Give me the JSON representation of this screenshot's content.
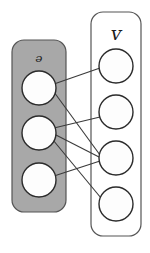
{
  "diagram": {
    "type": "bipartite-graph",
    "background_color": "#ffffff",
    "stroke_color": "#2b2b2b",
    "edge_color": "#3a3a3a"
  },
  "left_set": {
    "label": "ᵊ",
    "label_plain": "U",
    "box_fill": "#a8a8a8",
    "box_stroke": "#555555",
    "box": {
      "x": 12,
      "y": 40,
      "width": 54,
      "height": 172,
      "radius": 12
    },
    "node_fill": "#fdfdfd",
    "node_stroke": "#2b2b2b",
    "nodes": [
      {
        "id": "u1",
        "name": "u1",
        "cx": 39,
        "cy": 88,
        "r": 17
      },
      {
        "id": "u2",
        "name": "u2",
        "cx": 39,
        "cy": 133,
        "r": 17
      },
      {
        "id": "u3",
        "name": "u3",
        "cx": 39,
        "cy": 180,
        "r": 17
      }
    ],
    "label_pos": {
      "x": 39,
      "y": 63
    },
    "label_size": 19
  },
  "right_set": {
    "label": "ᴠ",
    "label_plain": "V",
    "box_fill": "#ffffff",
    "box_stroke": "#555555",
    "box": {
      "x": 91,
      "y": 12,
      "width": 50,
      "height": 224,
      "radius": 12
    },
    "node_fill": "#fdfdfd",
    "node_stroke": "#2b2b2b",
    "nodes": [
      {
        "id": "v1",
        "name": "v1",
        "cx": 116,
        "cy": 66,
        "r": 17
      },
      {
        "id": "v2",
        "name": "v2",
        "cx": 116,
        "cy": 112,
        "r": 17
      },
      {
        "id": "v3",
        "name": "v3",
        "cx": 116,
        "cy": 158,
        "r": 17
      },
      {
        "id": "v4",
        "name": "v4",
        "cx": 116,
        "cy": 204,
        "r": 17
      }
    ],
    "label_pos": {
      "x": 116,
      "y": 35
    },
    "label_size": 19
  },
  "edges": [
    {
      "name": "edge-u1-v1",
      "from": "u1",
      "to": "v1",
      "x1": 54,
      "y1": 84,
      "x2": 100,
      "y2": 68
    },
    {
      "name": "edge-u1-v3",
      "from": "u1",
      "to": "v3",
      "x1": 54,
      "y1": 92,
      "x2": 100,
      "y2": 155
    },
    {
      "name": "edge-u2-v2",
      "from": "u2",
      "to": "v2",
      "x1": 54,
      "y1": 128,
      "x2": 100,
      "y2": 117
    },
    {
      "name": "edge-u2-v3",
      "from": "u2",
      "to": "v3",
      "x1": 54,
      "y1": 134,
      "x2": 99,
      "y2": 157
    },
    {
      "name": "edge-u2-v4",
      "from": "u2",
      "to": "v4",
      "x1": 53,
      "y1": 140,
      "x2": 101,
      "y2": 198
    },
    {
      "name": "edge-u3-v3",
      "from": "u3",
      "to": "v3",
      "x1": 54,
      "y1": 176,
      "x2": 100,
      "y2": 161
    }
  ],
  "edge_stroke_width": 1.1
}
